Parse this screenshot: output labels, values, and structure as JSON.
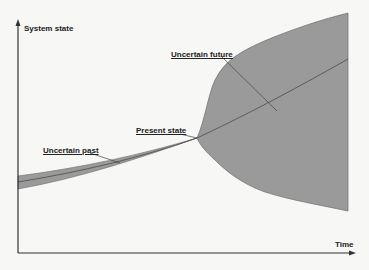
{
  "diagram": {
    "axes": {
      "y_label": "System state",
      "x_label": "Time"
    },
    "annotations": {
      "uncertain_future": "Uncertain future",
      "present_state": "Present state",
      "uncertain_past": "Uncertain past"
    },
    "colors": {
      "background": "#f7f7f5",
      "cone_fill": "#9a9a9a",
      "cone_edge": "#6d6d6d",
      "center_line": "#555555",
      "axis": "#333333",
      "text": "#222222"
    }
  }
}
